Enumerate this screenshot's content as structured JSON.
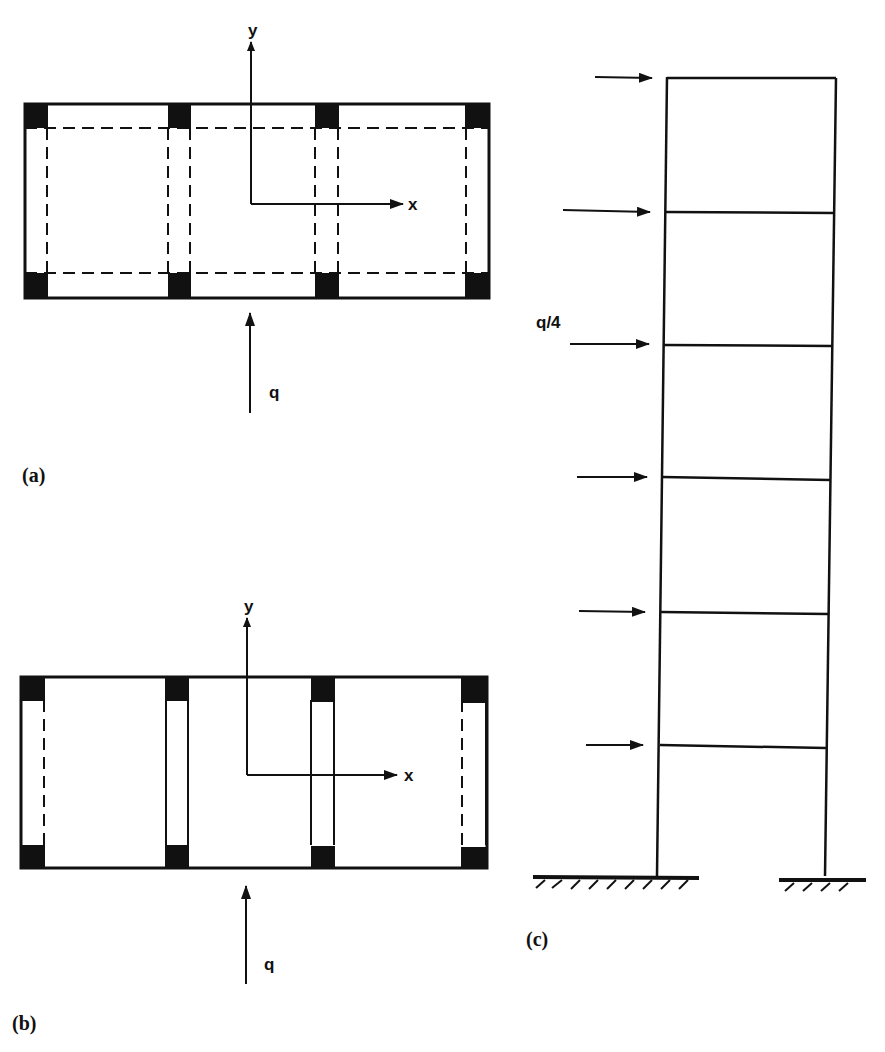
{
  "figure": {
    "panels": [
      {
        "id": "a",
        "caption": "(a)",
        "kind": "plan",
        "axis_x_label": "x",
        "axis_y_label": "y",
        "load_label": "q",
        "description": "Floor plan with 4 column pairs; dashed beam lines along both directions"
      },
      {
        "id": "b",
        "caption": "(b)",
        "kind": "plan",
        "axis_x_label": "x",
        "axis_y_label": "y",
        "load_label": "q",
        "description": "Floor plan with 4 shear-wall/column frames; dashed lines along column lines only"
      },
      {
        "id": "c",
        "caption": "(c)",
        "kind": "elevation",
        "stories": 6,
        "load_label": "q/4",
        "description": "Six-storey single-bay frame with lateral point loads at each floor level, fixed supports"
      }
    ]
  },
  "colors": {
    "ink": "#111111",
    "background": "#ffffff"
  }
}
